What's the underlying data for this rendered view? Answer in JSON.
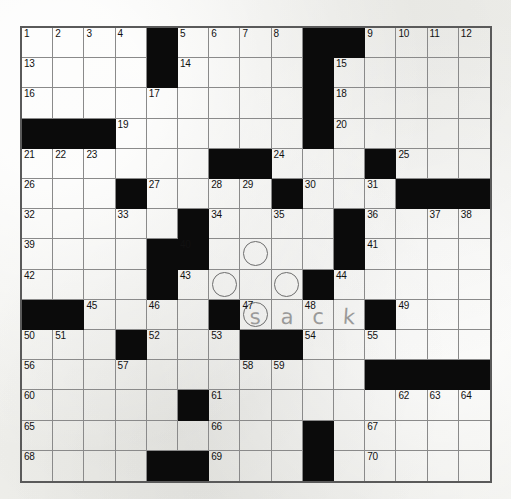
{
  "puzzle": {
    "title": "Crossword Puzzle Grid",
    "rows": 15,
    "cols": 15,
    "cell_size": 31.4,
    "row_height": 30.4,
    "colors": {
      "paper": "#f2f2ee",
      "block": "#0b0b0b",
      "grid_line": "#8a8a8a",
      "border": "#5a5a5a",
      "number": "#111111",
      "pencil": "#9a9a99",
      "circle": "#6d6d6d"
    },
    "blocks": [
      [
        0,
        4
      ],
      [
        0,
        9
      ],
      [
        0,
        10
      ],
      [
        1,
        4
      ],
      [
        1,
        9
      ],
      [
        2,
        9
      ],
      [
        3,
        0
      ],
      [
        3,
        1
      ],
      [
        3,
        2
      ],
      [
        3,
        9
      ],
      [
        4,
        6
      ],
      [
        4,
        7
      ],
      [
        4,
        11
      ],
      [
        5,
        3
      ],
      [
        5,
        8
      ],
      [
        5,
        12
      ],
      [
        5,
        13
      ],
      [
        5,
        14
      ],
      [
        6,
        5
      ],
      [
        6,
        10
      ],
      [
        7,
        4
      ],
      [
        7,
        10
      ],
      [
        7,
        5
      ],
      [
        8,
        4
      ],
      [
        8,
        9
      ],
      [
        9,
        0
      ],
      [
        9,
        1
      ],
      [
        9,
        6
      ],
      [
        9,
        11
      ],
      [
        10,
        3
      ],
      [
        10,
        7
      ],
      [
        10,
        8
      ],
      [
        11,
        11
      ],
      [
        11,
        12
      ],
      [
        11,
        13
      ],
      [
        11,
        14
      ],
      [
        12,
        5
      ],
      [
        13,
        9
      ],
      [
        14,
        4
      ],
      [
        14,
        5
      ],
      [
        14,
        9
      ]
    ],
    "circles": [
      [
        7,
        7
      ],
      [
        8,
        6
      ],
      [
        8,
        8
      ],
      [
        9,
        7
      ]
    ],
    "numbers": [
      {
        "r": 0,
        "c": 0,
        "n": "1"
      },
      {
        "r": 0,
        "c": 1,
        "n": "2"
      },
      {
        "r": 0,
        "c": 2,
        "n": "3"
      },
      {
        "r": 0,
        "c": 3,
        "n": "4"
      },
      {
        "r": 0,
        "c": 5,
        "n": "5"
      },
      {
        "r": 0,
        "c": 6,
        "n": "6"
      },
      {
        "r": 0,
        "c": 7,
        "n": "7"
      },
      {
        "r": 0,
        "c": 8,
        "n": "8"
      },
      {
        "r": 0,
        "c": 11,
        "n": "9"
      },
      {
        "r": 0,
        "c": 12,
        "n": "10"
      },
      {
        "r": 0,
        "c": 13,
        "n": "11"
      },
      {
        "r": 0,
        "c": 14,
        "n": "12"
      },
      {
        "r": 1,
        "c": 0,
        "n": "13"
      },
      {
        "r": 1,
        "c": 5,
        "n": "14"
      },
      {
        "r": 1,
        "c": 10,
        "n": "15"
      },
      {
        "r": 2,
        "c": 0,
        "n": "16"
      },
      {
        "r": 2,
        "c": 4,
        "n": "17"
      },
      {
        "r": 2,
        "c": 10,
        "n": "18"
      },
      {
        "r": 3,
        "c": 3,
        "n": "19"
      },
      {
        "r": 3,
        "c": 10,
        "n": "20"
      },
      {
        "r": 4,
        "c": 0,
        "n": "21"
      },
      {
        "r": 4,
        "c": 1,
        "n": "22"
      },
      {
        "r": 4,
        "c": 2,
        "n": "23"
      },
      {
        "r": 4,
        "c": 8,
        "n": "24"
      },
      {
        "r": 4,
        "c": 12,
        "n": "25"
      },
      {
        "r": 5,
        "c": 0,
        "n": "26"
      },
      {
        "r": 5,
        "c": 4,
        "n": "27"
      },
      {
        "r": 5,
        "c": 6,
        "n": "28"
      },
      {
        "r": 5,
        "c": 7,
        "n": "29"
      },
      {
        "r": 5,
        "c": 9,
        "n": "30"
      },
      {
        "r": 5,
        "c": 11,
        "n": "31"
      },
      {
        "r": 6,
        "c": 0,
        "n": "32"
      },
      {
        "r": 6,
        "c": 3,
        "n": "33"
      },
      {
        "r": 6,
        "c": 6,
        "n": "34"
      },
      {
        "r": 6,
        "c": 8,
        "n": "35"
      },
      {
        "r": 6,
        "c": 11,
        "n": "36"
      },
      {
        "r": 6,
        "c": 13,
        "n": "37"
      },
      {
        "r": 6,
        "c": 14,
        "n": "38"
      },
      {
        "r": 7,
        "c": 0,
        "n": "39"
      },
      {
        "r": 7,
        "c": 5,
        "n": "40"
      },
      {
        "r": 7,
        "c": 11,
        "n": "41"
      },
      {
        "r": 8,
        "c": 0,
        "n": "42"
      },
      {
        "r": 8,
        "c": 5,
        "n": "43"
      },
      {
        "r": 8,
        "c": 10,
        "n": "44"
      },
      {
        "r": 9,
        "c": 2,
        "n": "45"
      },
      {
        "r": 9,
        "c": 4,
        "n": "46"
      },
      {
        "r": 9,
        "c": 7,
        "n": "47"
      },
      {
        "r": 9,
        "c": 9,
        "n": "48"
      },
      {
        "r": 9,
        "c": 12,
        "n": "49"
      },
      {
        "r": 10,
        "c": 0,
        "n": "50"
      },
      {
        "r": 10,
        "c": 1,
        "n": "51"
      },
      {
        "r": 10,
        "c": 4,
        "n": "52"
      },
      {
        "r": 10,
        "c": 6,
        "n": "53"
      },
      {
        "r": 10,
        "c": 9,
        "n": "54"
      },
      {
        "r": 10,
        "c": 11,
        "n": "55"
      },
      {
        "r": 11,
        "c": 0,
        "n": "56"
      },
      {
        "r": 11,
        "c": 3,
        "n": "57"
      },
      {
        "r": 11,
        "c": 7,
        "n": "58"
      },
      {
        "r": 11,
        "c": 8,
        "n": "59"
      },
      {
        "r": 12,
        "c": 0,
        "n": "60"
      },
      {
        "r": 12,
        "c": 6,
        "n": "61"
      },
      {
        "r": 12,
        "c": 12,
        "n": "62"
      },
      {
        "r": 12,
        "c": 13,
        "n": "63"
      },
      {
        "r": 12,
        "c": 14,
        "n": "64"
      },
      {
        "r": 13,
        "c": 0,
        "n": "65"
      },
      {
        "r": 13,
        "c": 6,
        "n": "66"
      },
      {
        "r": 13,
        "c": 11,
        "n": "67"
      },
      {
        "r": 14,
        "c": 0,
        "n": "68"
      },
      {
        "r": 14,
        "c": 6,
        "n": "69"
      },
      {
        "r": 14,
        "c": 11,
        "n": "70"
      }
    ],
    "entries": [
      {
        "r": 9,
        "c": 7,
        "letter": "s",
        "style": "l1"
      },
      {
        "r": 9,
        "c": 8,
        "letter": "a",
        "style": "l2"
      },
      {
        "r": 9,
        "c": 9,
        "letter": "c",
        "style": "l3"
      },
      {
        "r": 9,
        "c": 10,
        "letter": "k",
        "style": "l4"
      }
    ],
    "handwritten_answer": "sack"
  }
}
